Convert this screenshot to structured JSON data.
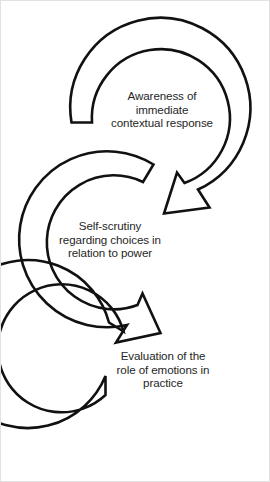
{
  "diagram": {
    "type": "cyclical-process",
    "stroke_color": "#111111",
    "text_color": "#262626",
    "background_color": "#ffffff",
    "steps": [
      {
        "id": "awareness",
        "order": 1,
        "label": "Awareness of\nimmediate\ncontextual response",
        "lines": [
          "Awareness of",
          "immediate",
          "contextual response"
        ]
      },
      {
        "id": "self-scrutiny",
        "order": 2,
        "label": "Self-scrutiny\nregarding choices in\nrelation to power",
        "lines": [
          "Self-scrutiny",
          "regarding choices in",
          "relation to power"
        ]
      },
      {
        "id": "evaluation",
        "order": 3,
        "label": "Evaluation of the\nrole of emotions in\npractice",
        "lines": [
          "Evaluation of the",
          "role of emotions in",
          "practice"
        ]
      }
    ],
    "connectors": [
      {
        "id": "arrow-awareness-to-self-scrutiny",
        "from": "awareness",
        "to": "self-scrutiny",
        "direction": "down-left"
      },
      {
        "id": "arrow-self-scrutiny-to-evaluation",
        "from": "self-scrutiny",
        "to": "evaluation",
        "direction": "down-right"
      }
    ]
  }
}
